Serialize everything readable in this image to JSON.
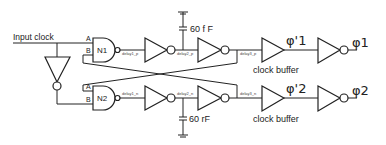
{
  "diagram": {
    "input_label": "Input clock",
    "gates": {
      "n1": "N1",
      "n2": "N2",
      "pin_a": "A",
      "pin_b": "B"
    },
    "nets": {
      "delay1_p": "delay1_p",
      "delay2_p": "delay2_p",
      "delay3_p": "delay3_p",
      "delay1_n": "delay1_n",
      "delay2_n": "delay2_n",
      "delay3_n": "delay3_n"
    },
    "capacitors": {
      "top": "60 f F",
      "bottom": "60 rF"
    },
    "buffers": {
      "top_label": "clock buffer",
      "bottom_label": "clock buffer"
    },
    "outputs": {
      "phi1_prime": "φ'1",
      "phi1": "φ1",
      "phi2_prime": "φ'2",
      "phi2": "φ2"
    }
  }
}
